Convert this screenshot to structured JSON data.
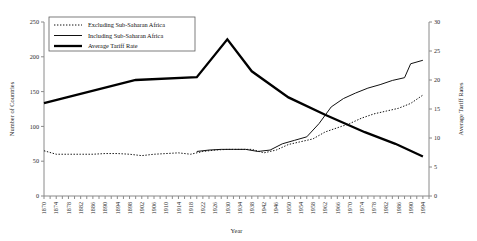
{
  "chart_data": {
    "type": "line",
    "title": "",
    "xlabel": "Year",
    "ylabel": "Number of Countries",
    "y2label": "Average Tariff Rates",
    "xlim": [
      1870,
      1996
    ],
    "ylim": [
      0,
      250
    ],
    "y2lim": [
      0,
      30
    ],
    "yticks": [
      0,
      50,
      100,
      150,
      200,
      250
    ],
    "y2ticks": [
      0,
      5,
      10,
      15,
      20,
      25,
      30
    ],
    "grid": false,
    "legend_position": "top-left",
    "xtick_labels": [
      "1870",
      "1874",
      "1878",
      "1882",
      "1886",
      "1890",
      "1894",
      "1898",
      "1902",
      "1906",
      "1910",
      "1914",
      "1918",
      "1922",
      "1926",
      "1930",
      "1934",
      "1938",
      "1942",
      "1946",
      "1950",
      "1954",
      "1958",
      "1962",
      "1966",
      "1970",
      "1974",
      "1978",
      "1982",
      "1986",
      "1990",
      "1994"
    ],
    "series": [
      {
        "name": "Excluding Sub-Saharan Africa",
        "axis": "left",
        "style": "dotted",
        "x": [
          1870,
          1874,
          1878,
          1882,
          1886,
          1890,
          1894,
          1898,
          1902,
          1906,
          1910,
          1914,
          1918,
          1922,
          1926,
          1930,
          1934,
          1938,
          1942,
          1946,
          1950,
          1954,
          1958,
          1962,
          1966,
          1970,
          1974,
          1978,
          1982,
          1986,
          1990,
          1994
        ],
        "values": [
          65,
          60,
          60,
          60,
          60,
          61,
          61,
          60,
          58,
          60,
          61,
          62,
          60,
          64,
          66,
          67,
          67,
          67,
          62,
          66,
          74,
          78,
          82,
          92,
          98,
          104,
          112,
          118,
          122,
          126,
          133,
          145
        ]
      },
      {
        "name": "Including Sub-Saharan Africa",
        "axis": "left",
        "style": "solid",
        "x": [
          1920,
          1924,
          1928,
          1932,
          1936,
          1940,
          1944,
          1948,
          1952,
          1956,
          1960,
          1964,
          1968,
          1972,
          1976,
          1980,
          1984,
          1988,
          1990,
          1994
        ],
        "values": [
          64,
          66,
          67,
          67,
          67,
          64,
          66,
          75,
          80,
          85,
          104,
          128,
          140,
          148,
          155,
          160,
          166,
          170,
          190,
          195
        ]
      },
      {
        "name": "Average Tariff Rate",
        "axis": "right",
        "style": "thick",
        "x": [
          1870,
          1900,
          1920,
          1930,
          1938,
          1950,
          1962,
          1975,
          1985,
          1994
        ],
        "values": [
          16.0,
          20.0,
          20.5,
          27.0,
          21.5,
          17.0,
          14.0,
          11.0,
          9.0,
          6.8
        ]
      }
    ]
  },
  "legend": {
    "items": [
      {
        "label": "Excluding Sub-Saharan Africa",
        "style": "dotted"
      },
      {
        "label": "Including Sub-Saharan Africa",
        "style": "solid"
      },
      {
        "label": "Average Tariff Rate",
        "style": "thick"
      }
    ]
  }
}
